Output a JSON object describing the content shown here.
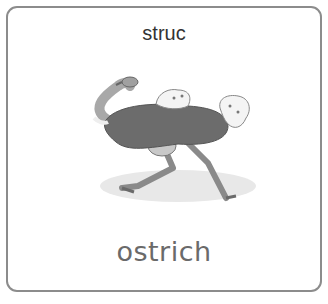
{
  "card": {
    "translation": "struc",
    "word": "ostrich",
    "image": {
      "icon": "ostrich-illustration",
      "alt": "ostrich"
    },
    "colors": {
      "border": "#8c8c8c",
      "title": "#333333",
      "word": "#6a6a6a"
    }
  }
}
